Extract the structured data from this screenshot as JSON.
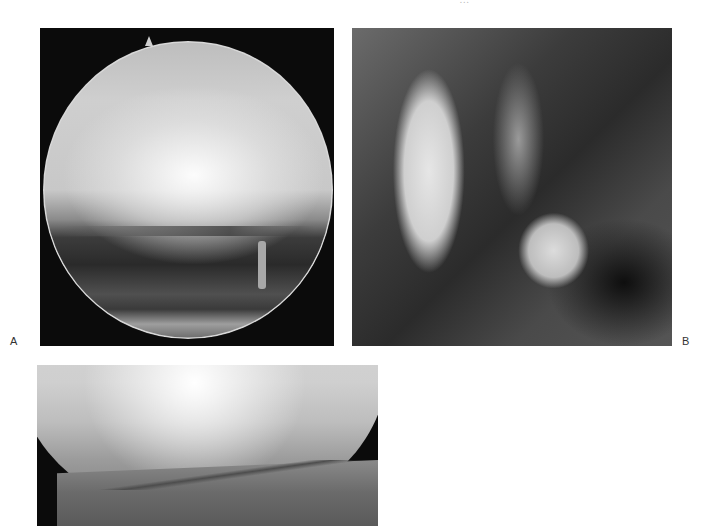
{
  "page": {
    "running_head": "…"
  },
  "figure": {
    "panels": [
      {
        "id": "A",
        "label": "A",
        "description": "arthroscopic circular view"
      },
      {
        "id": "B",
        "label": "B",
        "description": "gross anatomical specimen"
      },
      {
        "id": "C",
        "label": "",
        "description": "arthroscopic partial view"
      }
    ]
  }
}
